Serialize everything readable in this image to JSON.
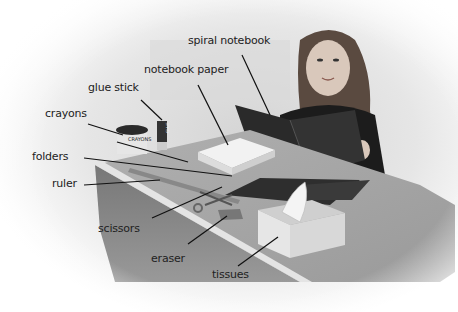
{
  "labels": {
    "spiral_notebook": "spiral notebook",
    "notebook_paper": "notebook paper",
    "glue_stick": "glue stick",
    "crayons": "crayons",
    "folders": "folders",
    "ruler": "ruler",
    "scissors": "scissors",
    "eraser": "eraser",
    "tissues": "tissues"
  },
  "object_text": {
    "glue_stick_text": "GLUE",
    "crayons_box_text": "CRAYONS"
  },
  "colors": {
    "label_text": "#222222",
    "leader_line": "#111111",
    "desk_top": "#9c9c9c",
    "desk_front": "#6e6e6e",
    "background_wall": "#e0e0e0"
  }
}
